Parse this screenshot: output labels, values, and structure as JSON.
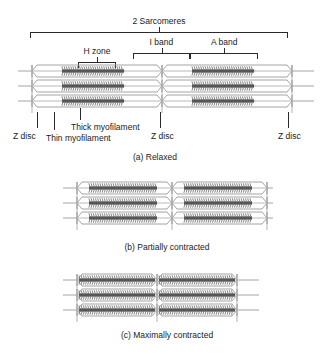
{
  "figure": {
    "title_bracket": "2 Sarcomeres",
    "brackets": [
      {
        "id": "sarcomeres",
        "label": "2 Sarcomeres",
        "x": 30,
        "y": 32,
        "w": 258,
        "stem_pct": 50
      },
      {
        "id": "i-band",
        "label": "I band",
        "x": 133,
        "y": 53,
        "w": 57,
        "stem_pct": 50
      },
      {
        "id": "a-band",
        "label": "A band",
        "x": 190,
        "y": 53,
        "w": 68,
        "stem_pct": 50
      },
      {
        "id": "h-zone",
        "label": "H zone",
        "x": 78,
        "y": 62,
        "w": 38,
        "stem_pct": 50
      }
    ],
    "labels": [
      {
        "id": "z-disc-left",
        "text": "Z disc",
        "x": 13,
        "y": 131,
        "leader_x": 37,
        "leader_y": 112,
        "leader_h": 16
      },
      {
        "id": "thin-myofilament",
        "text": "Thin myofilament",
        "x": 46,
        "y": 133,
        "leader_x": 54,
        "leader_y": 112,
        "leader_h": 18
      },
      {
        "id": "thick-myofilament",
        "text": "Thick myofilament",
        "x": 71,
        "y": 122,
        "leader_x": 80,
        "leader_y": 108,
        "leader_h": 12
      },
      {
        "id": "z-disc-middle",
        "text": "Z disc",
        "x": 151,
        "y": 131,
        "leader_x": 160,
        "leader_y": 112,
        "leader_h": 16
      },
      {
        "id": "z-disc-right",
        "text": "Z disc",
        "x": 278,
        "y": 131,
        "leader_x": 288,
        "leader_y": 112,
        "leader_h": 16
      }
    ],
    "panels": [
      {
        "id": "relaxed",
        "caption": "(a) Relaxed",
        "caption_x": 155,
        "caption_y": 152,
        "x": 18,
        "y": 63,
        "width": 300,
        "rows": 3,
        "half_width": 130,
        "filament_inset": 30,
        "gap": 16
      },
      {
        "id": "partially-contracted",
        "caption": "(b) Partially contracted",
        "caption_x": 167,
        "caption_y": 242,
        "x": 63,
        "y": 180,
        "width": 210,
        "rows": 3,
        "half_width": 95,
        "filament_inset": 12,
        "gap": 6
      },
      {
        "id": "maximally-contracted",
        "caption": "(c) Maximally contracted",
        "caption_x": 167,
        "caption_y": 330,
        "x": 63,
        "y": 272,
        "width": 210,
        "rows": 3,
        "half_width": 80,
        "filament_inset": 2,
        "gap": 0
      }
    ]
  },
  "colors": {
    "thick_filament": "#6f6f6f",
    "thick_filament_dark": "#565656",
    "thin_filament": "#b9b9b9",
    "z_disc": "#a8a8a8",
    "membrane": "#9a9a9a",
    "ink": "#2a2a2a",
    "background": "#ffffff"
  }
}
